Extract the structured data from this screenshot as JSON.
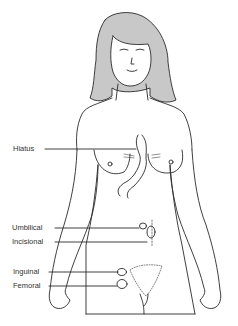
{
  "diagram": {
    "colors": {
      "line": "#2a2a2a",
      "hair": "#c8c8c8",
      "background": "#ffffff",
      "label_text": "#333333"
    },
    "labels": [
      {
        "id": "hiatus",
        "text": "Hiatus"
      },
      {
        "id": "umbilical",
        "text": "Umbilical"
      },
      {
        "id": "incisional",
        "text": "Incisional"
      },
      {
        "id": "inguinal",
        "text": "Inguinal"
      },
      {
        "id": "femoral",
        "text": "Femoral"
      }
    ]
  }
}
